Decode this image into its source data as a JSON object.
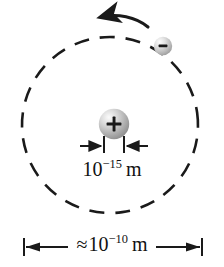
{
  "figure": {
    "name": "atom-scale-diagram",
    "background_color": "#ffffff",
    "line_color": "#1a1a1a",
    "sphere_color_light": "#f2f2f2",
    "sphere_color_mid": "#b8b8b8",
    "sphere_color_dark": "#8a8a8a"
  },
  "orbit": {
    "name": "electron-orbit",
    "style": "dashed",
    "center_x": 110,
    "center_y": 125,
    "radius": 88
  },
  "nucleus": {
    "label": "+",
    "charge": "positive",
    "center_x": 114,
    "center_y": 124,
    "radius": 15
  },
  "electron": {
    "label": "−",
    "charge": "negative",
    "center_x": 163,
    "center_y": 46,
    "radius": 9
  },
  "motion_arrow": {
    "name": "orbit-direction-arrow",
    "direction": "counterclockwise"
  },
  "annotations": {
    "nucleus_size": {
      "mantissa": "10",
      "exponent": "−15",
      "unit": "m",
      "full_text": "10⁻¹⁵ m"
    },
    "atom_size": {
      "approx_symbol": "≈",
      "mantissa": "10",
      "exponent": "−10",
      "unit": "m",
      "full_text": "≈10⁻¹⁰ m"
    }
  },
  "dimension_lines": {
    "nucleus_dimension": {
      "name": "nucleus-dimension-line",
      "y": 146,
      "left_tick_x": 104,
      "right_tick_x": 124,
      "style": "inward-arrows"
    },
    "atom_dimension": {
      "name": "atom-dimension-line",
      "y": 247,
      "left_x": 24,
      "right_x": 202,
      "style": "double-headed-arrow-with-end-ticks"
    }
  }
}
